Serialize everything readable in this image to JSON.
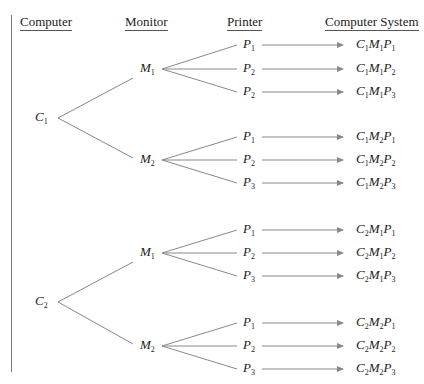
{
  "headers": {
    "computer": "Computer",
    "monitor": "Monitor",
    "printer": "Printer",
    "system": "Computer System"
  },
  "tree": {
    "computers": [
      {
        "label": "C",
        "sub": "1",
        "monitors": [
          {
            "label": "M",
            "sub": "1",
            "printers": [
              {
                "label": "P",
                "sub": "1",
                "result": "C₁M₁P₁"
              },
              {
                "label": "P",
                "sub": "2",
                "result": "C₁M₁P₂"
              },
              {
                "label": "P",
                "sub": "2",
                "result": "C₁M₁P₃"
              }
            ]
          },
          {
            "label": "M",
            "sub": "2",
            "printers": [
              {
                "label": "P",
                "sub": "1",
                "result": "C₁M₂P₁"
              },
              {
                "label": "P",
                "sub": "2",
                "result": "C₁M₂P₂"
              },
              {
                "label": "P",
                "sub": "3",
                "result": "C₁M₂P₃"
              }
            ]
          }
        ]
      },
      {
        "label": "C",
        "sub": "2",
        "monitors": [
          {
            "label": "M",
            "sub": "1",
            "printers": [
              {
                "label": "P",
                "sub": "1",
                "result": "C₂M₁P₁"
              },
              {
                "label": "P",
                "sub": "2",
                "result": "C₂M₁P₂"
              },
              {
                "label": "P",
                "sub": "3",
                "result": "C₂M₁P₃"
              }
            ]
          },
          {
            "label": "M",
            "sub": "2",
            "printers": [
              {
                "label": "P",
                "sub": "1",
                "result": "C₂M₂P₁"
              },
              {
                "label": "P",
                "sub": "2",
                "result": "C₂M₂P₂"
              },
              {
                "label": "P",
                "sub": "3",
                "result": "C₂M₂P₃"
              }
            ]
          }
        ]
      }
    ]
  },
  "colors": {
    "line": "#888888",
    "text": "#222222"
  }
}
